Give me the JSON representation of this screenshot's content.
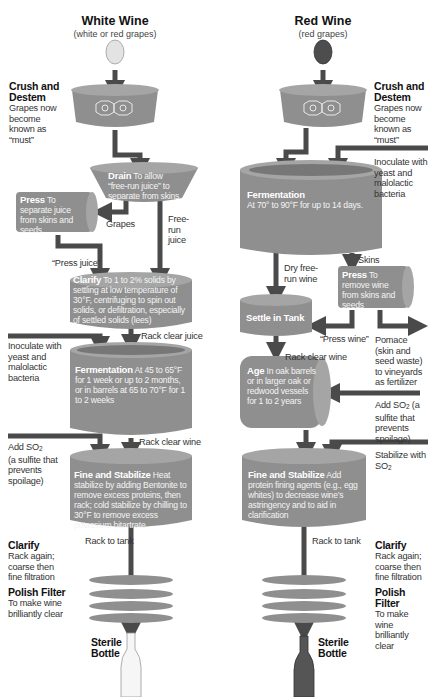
{
  "colors": {
    "vessel": "#8f8f8f",
    "vessel_top": "#a8a8a8",
    "vessel_rim": "#6e6e6e",
    "pipe": "#4a4a4a",
    "white_grape": "#e6e6e6",
    "red_grape": "#4a4a4a",
    "background": "#ffffff"
  },
  "white_wine": {
    "title": "White Wine",
    "subtitle": "(white or red grapes)",
    "crush": {
      "heading": "Crush and Destem",
      "text": "Grapes now become known as “must”"
    },
    "drain": {
      "heading": "Drain",
      "text": "To allow “free-run juice” to separate from skins"
    },
    "press": {
      "heading": "Press",
      "text": "To separate juice from skins and seeds"
    },
    "label_grapes": "Grapes",
    "label_free_run": "Free-run juice",
    "label_press_juice": "“Press juice”",
    "clarify": {
      "heading": "Clarify",
      "text": "To 1 to 2% solids by settling at low temperature of 30°F, centrifuging to spin out solids, or defiltration, especially of settled solids (lees)"
    },
    "label_rack_clear_juice": "Rack clear juice",
    "inoculate": "Inoculate with yeast and malolactic bacteria",
    "fermentation": {
      "heading": "Fermentation",
      "text": "At 45 to 65°F for 1 week or up to 2 months, or in barrels at 65 to 70°F for 1 to 2 weeks"
    },
    "label_rack_clear_wine": "Rack clear wine",
    "add_so2": {
      "line1": "Add SO",
      "sub": "2",
      "line2": "(a sulfite that prevents spoilage)"
    },
    "fine_stabilize": {
      "heading": "Fine and Stabilize",
      "text": "Heat stabilize by adding Bentonite to remove excess proteins, then rack; cold stabilize by chilling to 30°F to remove excess potassium bitartrate"
    },
    "label_rack_to_tank": "Rack to tank",
    "clarify2": {
      "heading": "Clarify",
      "text": "Rack again; coarse then fine filtration"
    },
    "polish": {
      "heading": "Polish Filter",
      "text": "To make wine brilliantly clear"
    },
    "bottle": "Sterile Bottle"
  },
  "red_wine": {
    "title": "Red Wine",
    "subtitle": "(red grapes)",
    "crush": {
      "heading": "Crush and Destem",
      "text": "Grapes now become known as “must”"
    },
    "inoculate": "Inoculate with yeast and malolactic bacteria",
    "fermentation": {
      "heading": "Fermentation",
      "text": "At 70° to 90°F for up to 14 days."
    },
    "label_skins": "Skins",
    "label_dry_free_run": "Dry free-run wine",
    "press": {
      "heading": "Press",
      "text": "To remove wine from skins and seeds"
    },
    "settle": {
      "heading": "Settle in Tank"
    },
    "label_press_wine": "“Press wine”",
    "pomace": "Pomace (skin and seed waste) to vineyards as fertilizer",
    "label_rack_clear_wine": "Rack clear wine",
    "age": {
      "heading": "Age",
      "text": "In oak barrels or in larger oak or redwood vessels for 1 to 2 years"
    },
    "add_so2": {
      "line1": "Add SO",
      "sub": "2",
      "line2": "(a sulfite that prevents spoilage)"
    },
    "stabilize_so2": {
      "line1": "Stabilize with SO",
      "sub": "2"
    },
    "fine_stabilize": {
      "heading": "Fine and Stabilize",
      "text": "Add protein fining agents (e.g., egg whites) to decrease wine’s astringency and to aid in clarification"
    },
    "label_rack_to_tank": "Rack to tank",
    "clarify2": {
      "heading": "Clarify",
      "text": "Rack again; coarse then fine filtration"
    },
    "polish": {
      "heading": "Polish Filter",
      "text": "To make wine brilliantly clear"
    },
    "bottle": "Sterile Bottle"
  }
}
